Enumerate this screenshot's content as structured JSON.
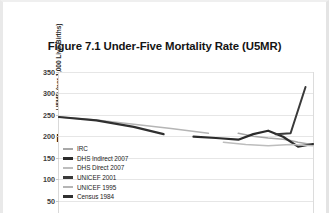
{
  "title": {
    "lines": [
      "Figure 7.1 Under-Five Mortality Rate (U5MR)",
      "Estimates for the Democratic",
      "Republic of the Congo (DRC), 1970–2004"
    ]
  },
  "colors": {
    "background": "#ffffff",
    "gridline": "#e6e6e6",
    "axis": "#d9d9d9",
    "text": "#141414",
    "series_dark": "#2b2b2b",
    "series_mid": "#555555",
    "series_light": "#a8a8a8",
    "series_lighter": "#c2c2c2"
  },
  "chart_data": {
    "type": "line",
    "title": "Figure 7.1 Under-Five Mortality Rate (U5MR) Estimates for the Democratic Republic of the Congo (DRC), 1970–2004",
    "xlabel": "",
    "ylabel": "U5MR (per 1,000 Live Births)",
    "ylim": [
      0,
      350
    ],
    "yticks": [
      50,
      100,
      150,
      200,
      250,
      300,
      350
    ],
    "ytick_labels": [
      "50",
      "100",
      "150",
      "200",
      "250",
      "300",
      "350"
    ],
    "xlim": [
      1970,
      2004
    ],
    "xticks": [],
    "xtick_labels": [],
    "grid": true,
    "legend_position": "lower-left-inside",
    "note": "x-axis tick labels are cropped out of the visible screenshot",
    "series": [
      {
        "name": "IRC",
        "color": "#a8a8a8",
        "width": 1.6,
        "x": [
          1994,
          1996,
          1998,
          2000,
          2001,
          2002,
          2003,
          2004
        ],
        "values": [
          207,
          200,
          196,
          193,
          190,
          186,
          183,
          180
        ]
      },
      {
        "name": "DHS Indirect 2007",
        "color": "#2b2b2b",
        "width": 2.2,
        "x": [
          1988,
          1991,
          1994,
          1996,
          1998,
          2000,
          2002,
          2004
        ],
        "values": [
          199,
          196,
          192,
          205,
          213,
          199,
          176,
          182
        ]
      },
      {
        "name": "DHS Direct 2007",
        "color": "#bdbdbd",
        "width": 1.4,
        "x": [
          1992,
          1995,
          1998,
          2001,
          2004
        ],
        "values": [
          186,
          181,
          178,
          181,
          178
        ]
      },
      {
        "name": "UNICEF 2001",
        "color": "#3a3a3a",
        "width": 2.0,
        "x": [
          1999,
          2001,
          2003
        ],
        "values": [
          205,
          207,
          315
        ]
      },
      {
        "name": "UNICEF 1995",
        "color": "#b5b5b5",
        "width": 1.5,
        "x": [
          1970,
          1975,
          1980,
          1985,
          1990
        ],
        "values": [
          245,
          238,
          228,
          218,
          207
        ]
      },
      {
        "name": "Census 1984",
        "color": "#303030",
        "width": 2.2,
        "x": [
          1970,
          1975,
          1980,
          1984
        ],
        "values": [
          245,
          237,
          222,
          205
        ]
      }
    ],
    "legend": [
      {
        "label": "IRC",
        "color": "#a8a8a8",
        "weight": "thin"
      },
      {
        "label": "DHS Indirect 2007",
        "color": "#2b2b2b",
        "weight": "thick"
      },
      {
        "label": "DHS Direct 2007",
        "color": "#bdbdbd",
        "weight": "thin"
      },
      {
        "label": "UNICEF 2001",
        "color": "#3a3a3a",
        "weight": "thick"
      },
      {
        "label": "UNICEF 1995",
        "color": "#b5b5b5",
        "weight": "thin"
      },
      {
        "label": "Census 1984",
        "color": "#303030",
        "weight": "thick"
      }
    ]
  }
}
